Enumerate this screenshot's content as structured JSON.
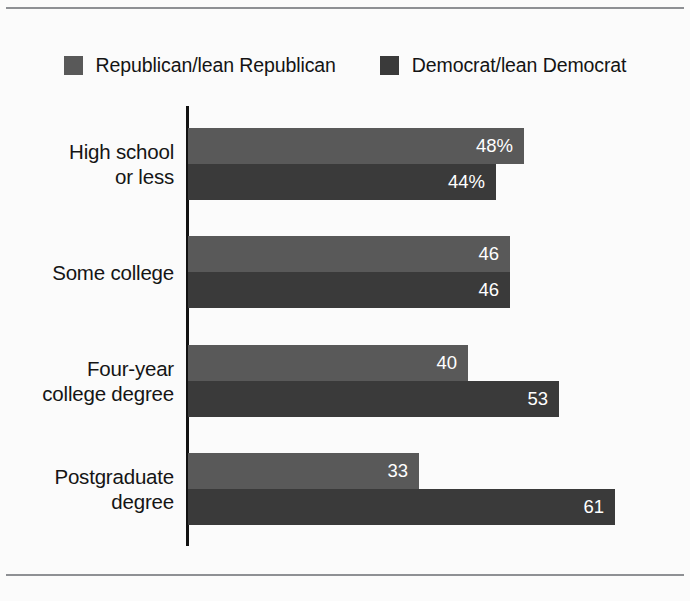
{
  "colors": {
    "republican": "#595959",
    "democrat": "#3a3a3a",
    "background": "#fbfbfb",
    "axis": "#121212",
    "rule": "#8e9094",
    "label_text": "#151515",
    "value_text": "#ffffff"
  },
  "legend": {
    "items": [
      {
        "label": "Republican/lean Republican",
        "color_key": "republican",
        "swatch_name": "legend-swatch-republican"
      },
      {
        "label": "Democrat/lean Democrat",
        "color_key": "democrat",
        "swatch_name": "legend-swatch-democrat"
      }
    ]
  },
  "chart_data": {
    "type": "bar",
    "orientation": "horizontal",
    "title": "",
    "subtitle": "",
    "xlabel": "",
    "ylabel": "",
    "grid": false,
    "legend_position": "top-center",
    "axis_max": 65,
    "categories": [
      "High school\nor less",
      "Some college",
      "Four-year\ncollege degree",
      "Postgraduate\ndegree"
    ],
    "category_lines": [
      [
        "High school",
        "or less"
      ],
      [
        "Some college"
      ],
      [
        "Four-year",
        "college degree"
      ],
      [
        "Postgraduate",
        "degree"
      ]
    ],
    "series": [
      {
        "name": "Republican/lean Republican",
        "color": "#595959",
        "values": [
          48,
          46,
          40,
          33
        ],
        "labels": [
          "48%",
          "46",
          "40",
          "33"
        ]
      },
      {
        "name": "Democrat/lean Democrat",
        "color": "#3a3a3a",
        "values": [
          44,
          46,
          53,
          61
        ],
        "labels": [
          "44%",
          "46",
          "53",
          "61"
        ]
      }
    ]
  }
}
